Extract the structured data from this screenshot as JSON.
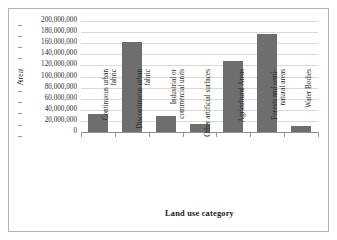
{
  "chart_data": {
    "type": "bar",
    "title": "",
    "xlabel": "Land use category",
    "ylabel": "Area",
    "categories": [
      "Continuous urban fabric",
      "Discontinuous urban fabric",
      "Industrial or commercial units",
      "Other artificial surfaces",
      "Agricultural Areas",
      "Forests and semi-natural areas",
      "Water Bodies"
    ],
    "values": [
      32000000,
      162000000,
      28000000,
      14000000,
      128000000,
      176000000,
      11000000
    ],
    "ylim": [
      0,
      200000000
    ],
    "ytick_values": [
      0,
      20000000,
      40000000,
      60000000,
      80000000,
      100000000,
      120000000,
      140000000,
      160000000,
      180000000,
      200000000
    ],
    "ytick_labels": [
      "0",
      "20,000,000",
      "40,000,000",
      "60,000,000",
      "80,000,000",
      "100,000,000",
      "120,000,000",
      "140,000,000",
      "160,000,000",
      "180,000,000",
      "200,000,000"
    ],
    "grid": true,
    "grid_axis": "y",
    "legend": false,
    "legend_position": "none",
    "bar_color": "#6e6e6e",
    "gridline_color": "#d9d9d9",
    "axis_color": "#8f8f8f",
    "background_color": "#ffffff",
    "border_color": "#b3b3b3"
  }
}
